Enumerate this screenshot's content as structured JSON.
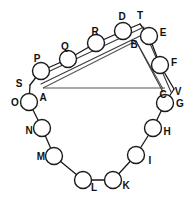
{
  "figure": {
    "width": 194,
    "height": 201,
    "background_color": "#ffffff",
    "ink_color": "#1a1a1a",
    "node_radius": 8.5,
    "small_node_radius": 7.5
  },
  "nodes": [
    {
      "id": "A",
      "label": "A",
      "cx": 43,
      "cy": 88,
      "r": 0,
      "type": "vertex",
      "label_x": 43,
      "label_y": 98
    },
    {
      "id": "B",
      "label": "B",
      "cx": 136,
      "cy": 41,
      "r": 0,
      "type": "vertex",
      "label_x": 134,
      "label_y": 45
    },
    {
      "id": "C",
      "label": "C",
      "cx": 163,
      "cy": 89,
      "r": 0,
      "type": "vertex",
      "label_x": 163,
      "label_y": 95
    },
    {
      "id": "P",
      "label": "P",
      "cx": 41,
      "cy": 71,
      "r": 8.5,
      "type": "roller",
      "label_x": 37,
      "label_y": 59
    },
    {
      "id": "Q",
      "label": "Q",
      "cx": 68,
      "cy": 59,
      "r": 8.5,
      "type": "roller",
      "label_x": 65,
      "label_y": 47
    },
    {
      "id": "R",
      "label": "R",
      "cx": 96,
      "cy": 43,
      "r": 8.5,
      "type": "roller",
      "label_x": 95,
      "label_y": 32
    },
    {
      "id": "D",
      "label": "D",
      "cx": 123,
      "cy": 31,
      "r": 8.5,
      "type": "roller",
      "label_x": 122,
      "label_y": 17
    },
    {
      "id": "E",
      "label": "E",
      "cx": 149,
      "cy": 36,
      "r": 8.5,
      "type": "roller",
      "label_x": 163,
      "label_y": 33
    },
    {
      "id": "F",
      "label": "F",
      "cx": 160,
      "cy": 65,
      "r": 8.5,
      "type": "roller",
      "label_x": 174,
      "label_y": 63
    },
    {
      "id": "G",
      "label": "G",
      "cx": 165,
      "cy": 103,
      "r": 8.5,
      "type": "roller",
      "label_x": 180,
      "label_y": 104
    },
    {
      "id": "H",
      "label": "H",
      "cx": 153,
      "cy": 128,
      "r": 8.5,
      "type": "roller",
      "label_x": 167,
      "label_y": 132
    },
    {
      "id": "I",
      "label": "I",
      "cx": 136,
      "cy": 155,
      "r": 8.5,
      "type": "roller",
      "label_x": 150,
      "label_y": 161
    },
    {
      "id": "K",
      "label": "K",
      "cx": 113,
      "cy": 180,
      "r": 8.5,
      "type": "roller",
      "label_x": 126,
      "label_y": 186
    },
    {
      "id": "L",
      "label": "L",
      "cx": 83,
      "cy": 180,
      "r": 8.5,
      "type": "roller",
      "label_x": 94,
      "label_y": 188
    },
    {
      "id": "M",
      "label": "M",
      "cx": 54,
      "cy": 156,
      "r": 8.5,
      "type": "roller",
      "label_x": 41,
      "label_y": 157
    },
    {
      "id": "N",
      "label": "N",
      "cx": 42,
      "cy": 128,
      "r": 8.5,
      "type": "roller",
      "label_x": 29,
      "label_y": 131
    },
    {
      "id": "O",
      "label": "O",
      "cx": 29,
      "cy": 102,
      "r": 8.5,
      "type": "roller",
      "label_x": 15,
      "label_y": 103
    },
    {
      "id": "S",
      "label": "S",
      "cx": 30,
      "cy": 85,
      "r": 0,
      "type": "tick",
      "label_x": 19,
      "label_y": 84
    },
    {
      "id": "T",
      "label": "T",
      "cx": 140,
      "cy": 24,
      "r": 0,
      "type": "tick",
      "label_x": 140,
      "label_y": 16
    },
    {
      "id": "V",
      "label": "V",
      "cx": 174,
      "cy": 89,
      "r": 0,
      "type": "tick",
      "label_x": 178,
      "label_y": 92
    }
  ],
  "links": [
    {
      "from": "S",
      "to": "O",
      "kind": "chain"
    },
    {
      "from": "O",
      "to": "N",
      "kind": "chain"
    },
    {
      "from": "N",
      "to": "M",
      "kind": "chain"
    },
    {
      "from": "M",
      "to": "L",
      "kind": "chain"
    },
    {
      "from": "L",
      "to": "K",
      "kind": "chain"
    },
    {
      "from": "K",
      "to": "I",
      "kind": "chain"
    },
    {
      "from": "I",
      "to": "H",
      "kind": "chain"
    },
    {
      "from": "H",
      "to": "G",
      "kind": "chain"
    },
    {
      "from": "G",
      "to": "V",
      "kind": "chain"
    },
    {
      "from": "V",
      "to": "F",
      "kind": "chain"
    },
    {
      "from": "F",
      "to": "E",
      "kind": "chain"
    },
    {
      "from": "E",
      "to": "T",
      "kind": "chain"
    },
    {
      "from": "T",
      "to": "D",
      "kind": "chain"
    },
    {
      "from": "D",
      "to": "R",
      "kind": "chain"
    },
    {
      "from": "R",
      "to": "Q",
      "kind": "chain"
    },
    {
      "from": "Q",
      "to": "P",
      "kind": "chain"
    },
    {
      "from": "P",
      "to": "S",
      "kind": "chain"
    },
    {
      "from": "A",
      "to": "B",
      "kind": "frame"
    },
    {
      "from": "B",
      "to": "C",
      "kind": "frame"
    },
    {
      "from": "A",
      "to": "C",
      "kind": "frame"
    }
  ],
  "rails": {
    "upper_outer": {
      "x1": 35,
      "y1": 78,
      "x2": 144,
      "y2": 27
    },
    "upper_inner": {
      "x1": 41,
      "y1": 84,
      "x2": 140,
      "y2": 36
    },
    "right_outer": {
      "x1": 144,
      "y1": 33,
      "x2": 170,
      "y2": 92
    },
    "right_inner": {
      "x1": 137,
      "y1": 42,
      "x2": 163,
      "y2": 92
    }
  },
  "triangle": {
    "a": {
      "x": 43,
      "y": 88
    },
    "b": {
      "x": 136,
      "y": 41
    },
    "c": {
      "x": 163,
      "y": 89
    },
    "base_label": "A-C baseline"
  }
}
